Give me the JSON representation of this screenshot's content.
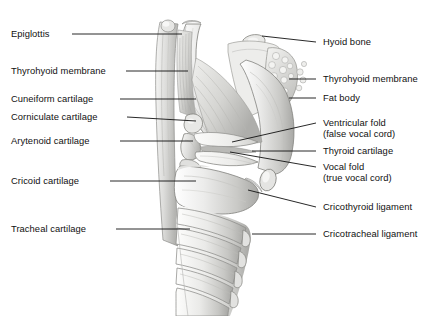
{
  "figure": {
    "background": "#ffffff",
    "ink": "#111111",
    "illustration": {
      "name": "larynx-sagittal-illustration",
      "style": "grayscale-anatomical-drawing",
      "palette": {
        "outline": "#6f6f6f",
        "light": "#f2f2f0",
        "mid": "#cfcfcc",
        "shadow": "#9a9a97",
        "dark": "#7c7c79"
      }
    },
    "labels_left": [
      {
        "id": "epiglottis",
        "text": "Epiglottis",
        "text_x": 11,
        "text_y": 28,
        "line_x1": 72,
        "line_y1": 34,
        "line_x2": 182,
        "line_y2": 34
      },
      {
        "id": "thyrohyoid-membrane-l",
        "text": "Thyrohyoid membrane",
        "text_x": 11,
        "text_y": 65,
        "line_x1": 126,
        "line_y1": 71,
        "line_x2": 188,
        "line_y2": 71
      },
      {
        "id": "cuneiform-cartilage",
        "text": "Cuneiform cartilage",
        "text_x": 11,
        "text_y": 93,
        "line_x1": 120,
        "line_y1": 99,
        "line_x2": 196,
        "line_y2": 99
      },
      {
        "id": "corniculate-cartilage",
        "text": "Corniculate cartilage",
        "text_x": 11,
        "text_y": 111,
        "line_x1": 127,
        "line_y1": 117,
        "line_x2": 196,
        "line_y2": 121
      },
      {
        "id": "arytenoid-cartilage",
        "text": "Arytenoid cartilage",
        "text_x": 11,
        "text_y": 135,
        "line_x1": 120,
        "line_y1": 141,
        "line_x2": 193,
        "line_y2": 141
      },
      {
        "id": "cricoid-cartilage",
        "text": "Cricoid cartilage",
        "text_x": 11,
        "text_y": 175,
        "line_x1": 110,
        "line_y1": 181,
        "line_x2": 196,
        "line_y2": 181
      },
      {
        "id": "tracheal-cartilage",
        "text": "Tracheal cartilage",
        "text_x": 11,
        "text_y": 223,
        "line_x1": 116,
        "line_y1": 229,
        "line_x2": 190,
        "line_y2": 229
      }
    ],
    "labels_right": [
      {
        "id": "hyoid-bone",
        "text": "Hyoid bone",
        "text_x": 323,
        "text_y": 36,
        "line_x1": 262,
        "line_y1": 36,
        "line_x2": 316,
        "line_y2": 42
      },
      {
        "id": "thyrohyoid-membrane-r",
        "text": "Thyrohyoid membrane",
        "text_x": 323,
        "text_y": 73,
        "line_x1": 289,
        "line_y1": 79,
        "line_x2": 316,
        "line_y2": 79
      },
      {
        "id": "fat-body",
        "text": "Fat body",
        "text_x": 323,
        "text_y": 92,
        "line_x1": 289,
        "line_y1": 98,
        "line_x2": 316,
        "line_y2": 98
      },
      {
        "id": "ventricular-fold",
        "text": "Ventricular fold",
        "text_x": 323,
        "text_y": 117,
        "text2": "(false vocal cord)",
        "text2_y": 128,
        "line_x1": 232,
        "line_y1": 142,
        "line_x2": 316,
        "line_y2": 123
      },
      {
        "id": "thyroid-cartilage",
        "text": "Thyroid cartilage",
        "text_x": 323,
        "text_y": 145,
        "line_x1": 252,
        "line_y1": 151,
        "line_x2": 316,
        "line_y2": 151
      },
      {
        "id": "vocal-fold",
        "text": "Vocal fold",
        "text_x": 323,
        "text_y": 161,
        "text2": "(true vocal cord)",
        "text2_y": 172,
        "line_x1": 230,
        "line_y1": 152,
        "line_x2": 316,
        "line_y2": 167
      },
      {
        "id": "cricothyroid-ligament",
        "text": "Cricothyroid ligament",
        "text_x": 323,
        "text_y": 201,
        "line_x1": 248,
        "line_y1": 190,
        "line_x2": 316,
        "line_y2": 207
      },
      {
        "id": "cricotracheal-ligament",
        "text": "Cricotracheal ligament",
        "text_x": 323,
        "text_y": 228,
        "line_x1": 252,
        "line_y1": 234,
        "line_x2": 316,
        "line_y2": 234
      }
    ]
  }
}
